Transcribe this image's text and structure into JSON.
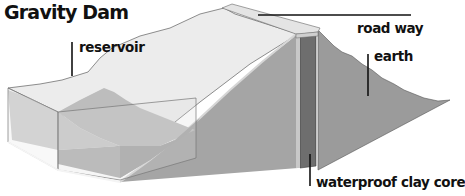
{
  "title": "Gravity Dam",
  "labels": {
    "reservoir": "reservoir",
    "road_way": "road way",
    "earth": "earth",
    "clay_core": "waterproof clay core"
  },
  "colors": {
    "background": "#ffffff",
    "earth_face": "#9a9a9a",
    "clay_core": "#6f6f6f",
    "roadway": "#e2e2e2",
    "upstream_slope": "#ebebeb",
    "water": "#b9b9b9",
    "leader_line": "#111111"
  }
}
